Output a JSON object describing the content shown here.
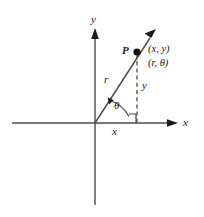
{
  "figure": {
    "type": "polar-coordinate-diagram",
    "background_color": "#ffffff",
    "line_color": "#4a4a4a",
    "text_color": "#1a1a1a"
  },
  "axes": {
    "x_label": "x",
    "y_label": "y",
    "origin": {
      "x": 95,
      "y": 123
    }
  },
  "point": {
    "name": "P",
    "cartesian_label": "(x, y)",
    "polar_label": "(r, θ)",
    "position": {
      "x": 137,
      "y": 52
    }
  },
  "segments": {
    "radius_label": "r",
    "angle_label": "θ",
    "horizontal_leg_label": "x",
    "vertical_leg_label": "y"
  },
  "markers": {
    "right_angle": "right-angle-square",
    "ray_arrow": "arrowhead",
    "angle_arc": "arc-with-arrowhead"
  }
}
